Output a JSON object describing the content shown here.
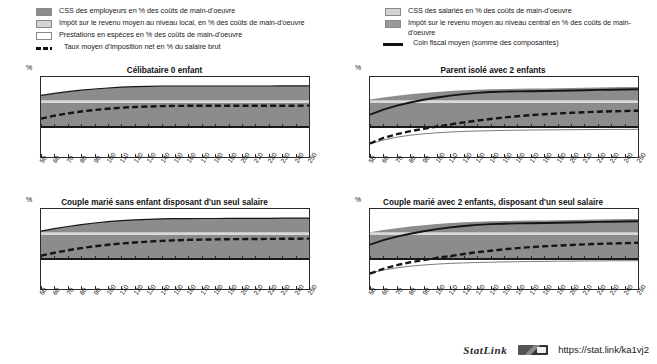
{
  "legend": {
    "left": [
      {
        "key": "swatch-dark",
        "label": "CSS des employeurs en % des coûts de main-d'oeuvre"
      },
      {
        "key": "swatch-light",
        "label": "Impôt sur le revenu moyen au niveau local, en % des coûts de main-d'oeuvre"
      },
      {
        "key": "swatch-white",
        "label": "Prestations en espèces en % des coûts de main-d'oeuvre"
      },
      {
        "key": "line-dashed",
        "label": "Taux moyen d'imposition net en % du salaire brut"
      }
    ],
    "right": [
      {
        "key": "swatch-light",
        "label": "CSS des salariés en % des coûts de main-d'oeuvre"
      },
      {
        "key": "swatch-mid",
        "label": "Impôt sur le revenu moyen au niveau central en %  des coûts de main-d'oeuvre"
      },
      {
        "key": "line-solid",
        "label": "Coin fiscal moyen (somme des composantes)"
      }
    ]
  },
  "axis": {
    "y_unit": "%",
    "y_ticks": [
      50,
      40,
      30,
      20,
      10,
      0,
      -10,
      -20,
      -30
    ],
    "x_ticks": [
      50,
      60,
      70,
      80,
      90,
      100,
      110,
      120,
      130,
      140,
      150,
      160,
      170,
      180,
      190,
      200,
      210,
      220,
      230,
      240,
      250
    ]
  },
  "colors": {
    "band_dark": "#8c8c8c",
    "band_light": "#d9d9d9",
    "band_white": "#ffffff",
    "line": "#151515",
    "axis": "#2b2b2b"
  },
  "footer": {
    "statlink_label": "StatLink",
    "statlink_icon": "statlink-barcode-icon",
    "url": "https://stat.link/ka1vj2"
  },
  "chart_data": [
    {
      "id": "celibataire-0-enfant",
      "type": "area",
      "title": "Célibataire 0 enfant",
      "xlabel": "",
      "ylabel": "%",
      "xlim": [
        50,
        250
      ],
      "ylim": [
        -30,
        50
      ],
      "grid": false,
      "legend_position": "top",
      "x": [
        50,
        60,
        70,
        80,
        90,
        100,
        110,
        120,
        130,
        140,
        150,
        160,
        170,
        180,
        190,
        200,
        210,
        220,
        230,
        240,
        250
      ],
      "series": [
        {
          "name": "Coin fiscal moyen (somme des composantes)",
          "style": "solid-line",
          "values": [
            31.6,
            33.6,
            35.3,
            36.8,
            38.0,
            39.0,
            39.8,
            40.3,
            40.7,
            41.0,
            41.0,
            41.0,
            41.0,
            41.0,
            41.0,
            41.0,
            41.0,
            41.0,
            41.1,
            41.1,
            41.1
          ]
        },
        {
          "name": "Taux moyen d'imposition net en % du salaire brut",
          "style": "dashed-line",
          "values": [
            8.3,
            11.3,
            13.6,
            15.5,
            17.0,
            18.3,
            19.3,
            20.0,
            20.5,
            20.9,
            21.1,
            21.2,
            21.2,
            21.2,
            21.2,
            21.2,
            21.3,
            21.3,
            21.3,
            21.3,
            21.4
          ]
        },
        {
          "name": "CSS des employeurs en % des coûts de main-d'oeuvre",
          "style": "band-dark",
          "values": [
            0,
            0,
            0,
            0,
            0,
            0,
            0,
            0,
            0,
            0,
            0,
            0,
            0,
            0,
            0,
            0,
            0,
            0,
            0,
            0,
            0
          ],
          "band_from": 0,
          "band_to": 24.5
        },
        {
          "name": "Impôt sur le revenu moyen au niveau local, en % des coûts de main-d'oeuvre",
          "style": "band-light",
          "band_from": 24.5,
          "band_to": 26.5
        },
        {
          "name": "Impôt sur le revenu moyen au niveau central en %  des coûts de main-d'oeuvre",
          "style": "band-mid-upper",
          "values": [
            31.6,
            33.6,
            35.3,
            36.8,
            38.0,
            39.0,
            39.8,
            40.3,
            40.7,
            41.0,
            41.0,
            41.0,
            41.0,
            41.0,
            41.0,
            41.0,
            41.0,
            41.0,
            41.1,
            41.1,
            41.1
          ],
          "band_from": 26.5
        }
      ]
    },
    {
      "id": "parent-isole-2-enfants",
      "type": "area",
      "title": "Parent isolé avec 2 enfants",
      "xlabel": "",
      "ylabel": "%",
      "xlim": [
        50,
        250
      ],
      "ylim": [
        -30,
        50
      ],
      "grid": false,
      "legend_position": "top",
      "x": [
        50,
        60,
        70,
        80,
        90,
        100,
        110,
        120,
        130,
        140,
        150,
        160,
        170,
        180,
        190,
        200,
        210,
        220,
        230,
        240,
        250
      ],
      "series": [
        {
          "name": "Coin fiscal moyen (somme des composantes)",
          "style": "solid-line",
          "values": [
            12.3,
            17.3,
            21.3,
            24.5,
            27.2,
            29.5,
            31.4,
            32.9,
            34.1,
            35.0,
            35.4,
            35.6,
            35.8,
            36.0,
            36.2,
            36.5,
            36.8,
            37.1,
            37.3,
            37.5,
            37.7
          ]
        },
        {
          "name": "Taux moyen d'imposition net en % du salaire brut",
          "style": "dashed-line",
          "values": [
            -16.5,
            -11.0,
            -7.2,
            -4.2,
            -1.8,
            0.5,
            2.6,
            4.6,
            6.4,
            8.0,
            9.5,
            10.8,
            11.9,
            12.8,
            13.5,
            14.2,
            14.8,
            15.3,
            15.7,
            16.0,
            16.3
          ]
        },
        {
          "name": "Prestations en espèces en % des coûts de main-d'oeuvre",
          "style": "benefit-line",
          "values": [
            -17.0,
            -13.0,
            -10.2,
            -8.2,
            -6.8,
            -5.8,
            -5.0,
            -4.4,
            -4.0,
            -3.7,
            -3.4,
            -3.2,
            -3.0,
            -2.9,
            -2.8,
            -2.7,
            -2.6,
            -2.5,
            -2.4,
            -2.4,
            -2.3
          ]
        },
        {
          "name": "CSS des employeurs en % des coûts de main-d'oeuvre",
          "style": "band-dark",
          "band_from": 0,
          "band_to": 24.5
        },
        {
          "name": "Impôt sur le revenu moyen au niveau local, en % des coûts de main-d'oeuvre",
          "style": "band-light",
          "band_from": 24.5,
          "band_to": 26.5
        },
        {
          "name": "Impôt sur le revenu moyen au niveau central en %  des coûts de main-d'oeuvre",
          "style": "band-mid-upper",
          "values": [
            27.5,
            29.5,
            31.2,
            32.7,
            34.0,
            35.1,
            36.0,
            36.7,
            37.3,
            37.8,
            38.0,
            38.2,
            38.4,
            38.6,
            38.8,
            39.0,
            39.3,
            39.6,
            39.8,
            40.0,
            40.1
          ],
          "band_from": 26.5
        }
      ]
    },
    {
      "id": "couple-marie-sans-enfant",
      "type": "area",
      "title": "Couple marié sans enfant disposant d'un seul salaire",
      "xlabel": "",
      "ylabel": "%",
      "xlim": [
        50,
        250
      ],
      "ylim": [
        -30,
        50
      ],
      "grid": false,
      "legend_position": "top",
      "x": [
        50,
        60,
        70,
        80,
        90,
        100,
        110,
        120,
        130,
        140,
        150,
        160,
        170,
        180,
        190,
        200,
        210,
        220,
        230,
        240,
        250
      ],
      "series": [
        {
          "name": "Coin fiscal moyen (somme des composantes)",
          "style": "solid-line",
          "values": [
            27.8,
            30.3,
            32.5,
            34.4,
            36.0,
            37.3,
            38.3,
            39.1,
            39.7,
            40.1,
            40.3,
            40.4,
            40.5,
            40.5,
            40.6,
            40.6,
            40.7,
            40.7,
            40.8,
            40.8,
            40.9
          ]
        },
        {
          "name": "Taux moyen d'imposition net en % du salaire brut",
          "style": "dashed-line",
          "values": [
            3.3,
            6.2,
            8.7,
            10.9,
            12.7,
            14.2,
            15.5,
            16.5,
            17.4,
            18.1,
            18.7,
            19.1,
            19.4,
            19.6,
            19.8,
            19.9,
            20.0,
            20.1,
            20.2,
            20.3,
            20.4
          ]
        },
        {
          "name": "CSS des employeurs en % des coûts de main-d'oeuvre",
          "style": "band-dark",
          "band_from": 0,
          "band_to": 24.5
        },
        {
          "name": "Impôt sur le revenu moyen au niveau local, en % des coûts de main-d'oeuvre",
          "style": "band-light",
          "band_from": 24.5,
          "band_to": 26.5
        },
        {
          "name": "Impôt sur le revenu moyen au niveau central en %  des coûts de main-d'oeuvre",
          "style": "band-mid-upper",
          "values": [
            27.8,
            30.3,
            32.5,
            34.4,
            36.0,
            37.3,
            38.3,
            39.1,
            39.7,
            40.1,
            40.3,
            40.4,
            40.5,
            40.5,
            40.6,
            40.6,
            40.7,
            40.7,
            40.8,
            40.8,
            40.9
          ],
          "band_from": 26.5
        }
      ]
    },
    {
      "id": "couple-marie-2-enfants",
      "type": "area",
      "title": "Couple marié avec 2 enfants, disposant d'un seul salaire",
      "xlabel": "",
      "ylabel": "%",
      "xlim": [
        50,
        250
      ],
      "ylim": [
        -30,
        50
      ],
      "grid": false,
      "legend_position": "top",
      "x": [
        50,
        60,
        70,
        80,
        90,
        100,
        110,
        120,
        130,
        140,
        150,
        160,
        170,
        180,
        190,
        200,
        210,
        220,
        230,
        240,
        250
      ],
      "series": [
        {
          "name": "Coin fiscal moyen (somme des composantes)",
          "style": "solid-line",
          "values": [
            14.3,
            18.8,
            22.4,
            25.3,
            27.8,
            29.9,
            31.6,
            33.0,
            34.1,
            34.9,
            35.3,
            35.6,
            35.8,
            36.0,
            36.2,
            36.5,
            36.8,
            37.1,
            37.3,
            37.5,
            37.7
          ]
        },
        {
          "name": "Taux moyen d'imposition net en % du salaire brut",
          "style": "dashed-line",
          "values": [
            -14.5,
            -9.8,
            -6.2,
            -3.3,
            -1.0,
            1.0,
            3.0,
            5.0,
            6.8,
            8.3,
            9.7,
            10.9,
            11.9,
            12.7,
            13.4,
            14.0,
            14.6,
            15.1,
            15.5,
            15.9,
            16.2
          ]
        },
        {
          "name": "Prestations en espèces en % des coûts de main-d'oeuvre",
          "style": "benefit-line",
          "values": [
            -14.0,
            -11.0,
            -8.8,
            -7.2,
            -6.0,
            -5.1,
            -4.4,
            -3.9,
            -3.5,
            -3.2,
            -2.9,
            -2.7,
            -2.5,
            -2.4,
            -2.2,
            -2.1,
            -2.0,
            -1.9,
            -1.8,
            -1.8,
            -1.7
          ]
        },
        {
          "name": "CSS des employeurs en % des coûts de main-d'oeuvre",
          "style": "band-dark",
          "band_from": 0,
          "band_to": 24.5
        },
        {
          "name": "Impôt sur le revenu moyen au niveau local, en % des coûts de main-d'oeuvre",
          "style": "band-light",
          "band_from": 24.5,
          "band_to": 26.5
        },
        {
          "name": "Impôt sur le revenu moyen au niveau central en %  des coûts de main-d'oeuvre",
          "style": "band-mid-upper",
          "values": [
            26.8,
            29.0,
            30.8,
            32.4,
            33.8,
            34.9,
            35.9,
            36.7,
            37.3,
            37.7,
            38.0,
            38.2,
            38.4,
            38.6,
            38.8,
            39.0,
            39.3,
            39.6,
            39.8,
            40.0,
            40.1
          ],
          "band_from": 26.5
        }
      ]
    }
  ]
}
